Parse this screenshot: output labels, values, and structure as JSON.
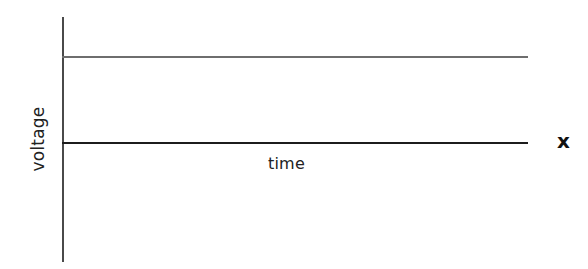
{
  "figure": {
    "background_color": "#ffffff",
    "width": 588,
    "height": 269
  },
  "labels": {
    "y_axis": "voltage",
    "x_axis": "time",
    "right_marker": "x"
  },
  "colors": {
    "voltage_axis": "#4a4a4a",
    "time_axis": "#1c1c1c",
    "voltage_trace": "#6e6e6e",
    "text": "#222222",
    "marker_text": "#111111"
  },
  "chart_data": {
    "type": "line",
    "title": "",
    "subtitle": "",
    "xlabel": "time",
    "ylabel": "voltage",
    "grid": false,
    "legend": null,
    "axis_style": {
      "y_axis_drawn": true,
      "x_axis_drawn": true,
      "x_tick_labels": [],
      "y_tick_labels": [],
      "ticks_shown": false
    },
    "xlim": [
      0,
      1
    ],
    "ylim": [
      0,
      1
    ],
    "series": [
      {
        "name": "voltage",
        "color": "#6e6e6e",
        "x": [
          0,
          1
        ],
        "values": [
          1,
          1
        ],
        "description": "constant high voltage level, flat horizontal line"
      },
      {
        "name": "baseline",
        "color": "#1c1c1c",
        "x": [
          0,
          1
        ],
        "values": [
          0,
          0
        ],
        "description": "zero-volt baseline / time axis"
      }
    ],
    "annotations": [
      {
        "text": "x",
        "position": "right of time axis end",
        "style": "bold"
      }
    ]
  }
}
